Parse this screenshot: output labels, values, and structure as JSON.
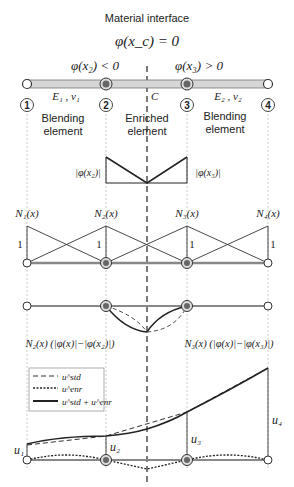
{
  "title": "Material interface",
  "interface_condition": "φ(x_c) = 0",
  "left_condition": "φ(x₂) < 0",
  "right_condition": "φ(x₃) > 0",
  "interface_point_label": "C",
  "material_left": "E₁ , ν₁",
  "material_right": "E₂ , ν₂",
  "nodes": [
    "1",
    "2",
    "3",
    "4"
  ],
  "elements": [
    {
      "line1": "Blending",
      "line2": "element"
    },
    {
      "line1": "Enriched",
      "line2": "element"
    },
    {
      "line1": "Blending",
      "line2": "element"
    }
  ],
  "level_set_labels": {
    "left": "|φ(x₂)|",
    "right": "|φ(x₃)|"
  },
  "shape_functions": [
    "N₁(x)",
    "N₂(x)",
    "N₃(x)",
    "N₄(x)"
  ],
  "unit_label": "1",
  "enriched_functions": {
    "left": "N₂(x) (|φ(x)|−|φ(x₂)|)",
    "right": "N₃(x) (|φ(x)|−|φ(x₃)|)"
  },
  "legend": [
    {
      "style": "dashed",
      "label": "u^std"
    },
    {
      "style": "dotted",
      "label": "u^enr"
    },
    {
      "style": "solid",
      "label": "u^std + u^enr"
    }
  ],
  "displacement_labels": [
    "u₁",
    "u₂",
    "u₃",
    "u₄"
  ],
  "colors": {
    "bar": "#cfcfcf",
    "node_enriched": "#6a6a6a",
    "line": "#222222",
    "guide": "#aaaaaa"
  }
}
